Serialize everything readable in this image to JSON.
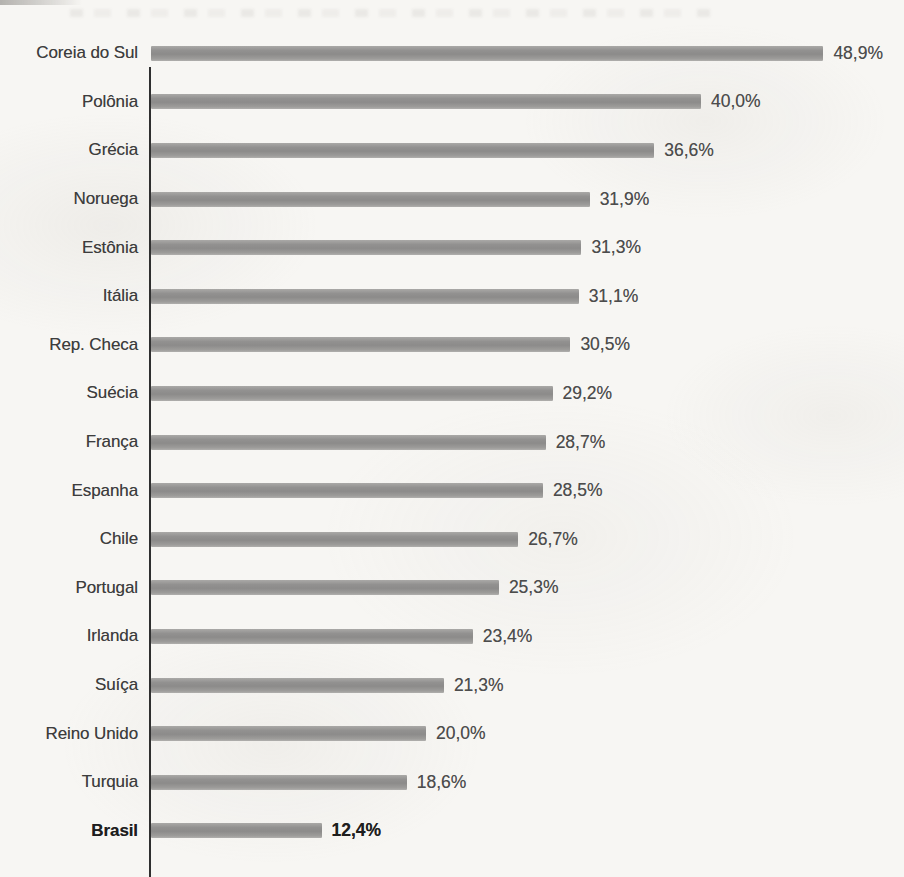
{
  "page": {
    "background_color": "#f7f6f3",
    "artifacts": [
      "top-left-edge-smudge",
      "faint-bleed-through-text-top"
    ]
  },
  "chart_data": {
    "type": "bar",
    "orientation": "horizontal",
    "title": "",
    "xlabel": "",
    "ylabel": "",
    "xlim": [
      0,
      50
    ],
    "grid": false,
    "legend": false,
    "bar_color": "#949392",
    "axis_color": "#2f2f2f",
    "categories": [
      "Coreia do Sul",
      "Polônia",
      "Grécia",
      "Noruega",
      "Estônia",
      "Itália",
      "Rep. Checa",
      "Suécia",
      "França",
      "Espanha",
      "Chile",
      "Portugal",
      "Irlanda",
      "Suíça",
      "Reino Unido",
      "Turquia",
      "Brasil"
    ],
    "values": [
      48.9,
      40.0,
      36.6,
      31.9,
      31.3,
      31.1,
      30.5,
      29.2,
      28.7,
      28.5,
      26.7,
      25.3,
      23.4,
      21.3,
      20.0,
      18.6,
      12.4
    ],
    "value_labels": [
      "48,9%",
      "40,0%",
      "36,6%",
      "31,9%",
      "31,3%",
      "31,1%",
      "30,5%",
      "29,2%",
      "28,7%",
      "28,5%",
      "26,7%",
      "25,3%",
      "23,4%",
      "21,3%",
      "20,0%",
      "18,6%",
      "12,4%"
    ],
    "emphasized_category": "Brasil"
  }
}
